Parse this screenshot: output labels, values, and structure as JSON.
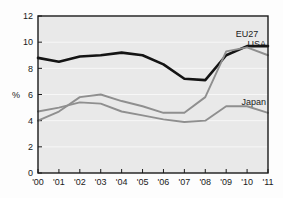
{
  "chart_data": {
    "type": "line",
    "title": "",
    "subtitle": "",
    "xlabel": "",
    "ylabel": "%",
    "x": [
      "'00",
      "'01",
      "'02",
      "'03",
      "'04",
      "'05",
      "'06",
      "'07",
      "'08",
      "'09",
      "'10",
      "'11"
    ],
    "xtick_labels": [
      "'00",
      "'01",
      "'02",
      "'03",
      "'04",
      "'05",
      "'06",
      "'07",
      "'08",
      "'09",
      "'10",
      "'11"
    ],
    "ytick_labels": [
      "0",
      "2",
      "4",
      "6",
      "8",
      "10",
      "12"
    ],
    "ytick_values": [
      0,
      2,
      4,
      6,
      8,
      10,
      12
    ],
    "ylim": [
      0,
      12
    ],
    "grid": true,
    "grid_axis": "y",
    "legend_position": "inline-right-annotations",
    "plot_background": "#e9e9e9",
    "grid_color": "#f7f7f7",
    "axis_color": "#1a1a1a",
    "series": [
      {
        "name": "EU27",
        "color": "#141414",
        "width": 2.6,
        "label_x": "'10",
        "values": [
          8.8,
          8.5,
          8.9,
          9.0,
          9.2,
          9.0,
          8.3,
          7.2,
          7.1,
          9.0,
          9.7,
          9.7
        ]
      },
      {
        "name": "USA",
        "color": "#8f8f8f",
        "width": 1.9,
        "label_x": "'11",
        "values": [
          4.0,
          4.7,
          5.8,
          6.0,
          5.5,
          5.1,
          4.6,
          4.6,
          5.8,
          9.3,
          9.6,
          9.0
        ]
      },
      {
        "name": "Japan",
        "color": "#8f8f8f",
        "width": 1.9,
        "label_x": "'11",
        "values": [
          4.7,
          5.0,
          5.4,
          5.3,
          4.7,
          4.4,
          4.1,
          3.9,
          4.0,
          5.1,
          5.1,
          4.6
        ]
      }
    ],
    "annotations": [
      {
        "text": "EU27",
        "series": "EU27"
      },
      {
        "text": "USA",
        "series": "USA"
      },
      {
        "text": "Japan",
        "series": "Japan"
      }
    ]
  }
}
